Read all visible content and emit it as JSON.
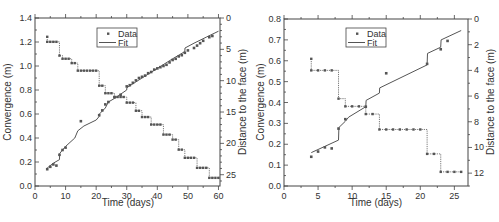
{
  "chart_data": [
    {
      "type": "scatter+line",
      "panel": "left",
      "title": "",
      "xlabel": "Time (days)",
      "ylabel": "Convergence (m)",
      "y2label": "Distance to the face (m)",
      "xlim": [
        0,
        60.5
      ],
      "ylim": [
        0.0,
        1.4
      ],
      "y2lim": [
        0,
        26.8
      ],
      "y2_inverted": true,
      "xticks": [
        0,
        10,
        20,
        30,
        40,
        50,
        60
      ],
      "yticks": [
        0.0,
        0.2,
        0.4,
        0.6,
        0.8,
        1.0,
        1.2,
        1.4
      ],
      "y2ticks": [
        0,
        5,
        10,
        15,
        20,
        25
      ],
      "legend": {
        "position": "upper-center",
        "entries": [
          "Data",
          "Fit"
        ]
      },
      "series": [
        {
          "name": "Data",
          "axis": "left",
          "style": "markers",
          "x": [
            4,
            5,
            6,
            7,
            8,
            9,
            10,
            15,
            21,
            22,
            23,
            24,
            26,
            28,
            30,
            31,
            32,
            33,
            34,
            35,
            36,
            37,
            38,
            39,
            40,
            41,
            42,
            43,
            44,
            45,
            46,
            47,
            48,
            49,
            50,
            52,
            53,
            54,
            55,
            57,
            58
          ],
          "values": [
            0.14,
            0.16,
            0.18,
            0.17,
            0.26,
            0.3,
            0.32,
            0.54,
            0.59,
            0.63,
            0.68,
            0.7,
            0.74,
            0.76,
            0.83,
            0.84,
            0.86,
            0.88,
            0.9,
            0.91,
            0.92,
            0.94,
            0.95,
            0.97,
            0.98,
            0.99,
            1.0,
            1.01,
            1.03,
            1.05,
            1.06,
            1.08,
            1.09,
            1.11,
            1.13,
            1.15,
            1.17,
            1.19,
            1.21,
            1.24,
            1.25
          ]
        },
        {
          "name": "Fit",
          "axis": "left",
          "style": "line",
          "x": [
            4,
            6,
            8,
            8.05,
            9,
            10,
            13,
            14,
            16,
            20,
            21,
            21.05,
            23,
            24,
            26,
            30,
            30.05,
            35,
            40,
            45,
            49,
            49.05,
            52,
            56,
            60
          ],
          "values": [
            0.15,
            0.19,
            0.22,
            0.27,
            0.3,
            0.33,
            0.4,
            0.46,
            0.5,
            0.55,
            0.58,
            0.6,
            0.65,
            0.7,
            0.73,
            0.8,
            0.82,
            0.9,
            0.98,
            1.06,
            1.12,
            1.15,
            1.19,
            1.24,
            1.29
          ]
        },
        {
          "name": "Distance to the face",
          "axis": "right",
          "style": "step-markers",
          "x": [
            4,
            5,
            6,
            7,
            8,
            9,
            10,
            11,
            12,
            13,
            14,
            15,
            16,
            17,
            18,
            19,
            20,
            21,
            22,
            23,
            24,
            25,
            26,
            27,
            28,
            29,
            30,
            31,
            32,
            33,
            34,
            35,
            36,
            37,
            38,
            39,
            40,
            41,
            42,
            43,
            44,
            45,
            46,
            47,
            48,
            49,
            50,
            51,
            52,
            53,
            54,
            55,
            56,
            57,
            58,
            59,
            60
          ],
          "values": [
            3.8,
            3.8,
            3.8,
            3.8,
            6.0,
            6.5,
            6.5,
            6.5,
            7.2,
            7.2,
            8.4,
            8.4,
            8.4,
            8.4,
            8.4,
            8.4,
            8.4,
            10.8,
            10.8,
            12.0,
            12.0,
            12.0,
            12.6,
            12.6,
            12.6,
            12.6,
            13.5,
            13.5,
            13.5,
            14.8,
            14.8,
            15.8,
            15.8,
            15.8,
            17.0,
            17.0,
            17.0,
            17.0,
            18.6,
            18.6,
            18.6,
            19.4,
            19.4,
            21.0,
            21.0,
            22.3,
            22.3,
            22.3,
            22.3,
            23.9,
            23.9,
            23.9,
            23.9,
            25.5,
            25.5,
            25.5,
            25.5
          ],
          "first_point": {
            "x": 4,
            "value": 3.0
          }
        }
      ]
    },
    {
      "type": "scatter+line",
      "panel": "right",
      "title": "",
      "xlabel": "Time (days)",
      "ylabel": "Convergence (m)",
      "y2label": "Distance to the face (m)",
      "xlim": [
        0,
        27
      ],
      "ylim": [
        0.0,
        0.8
      ],
      "y2lim": [
        0,
        13
      ],
      "y2_inverted": true,
      "xticks": [
        0,
        5,
        10,
        15,
        20,
        25
      ],
      "yticks": [
        0.0,
        0.1,
        0.2,
        0.3,
        0.4,
        0.5,
        0.6,
        0.7,
        0.8
      ],
      "y2ticks": [
        0,
        2,
        4,
        6,
        8,
        10,
        12
      ],
      "legend": {
        "position": "upper-center",
        "entries": [
          "Data",
          "Fit"
        ]
      },
      "series": [
        {
          "name": "Data",
          "axis": "left",
          "style": "markers",
          "x": [
            4,
            5,
            6,
            7,
            8,
            9,
            12,
            15,
            21,
            23,
            24
          ],
          "values": [
            0.14,
            0.165,
            0.185,
            0.18,
            0.275,
            0.32,
            0.38,
            0.54,
            0.585,
            0.655,
            0.695
          ]
        },
        {
          "name": "Fit",
          "axis": "left",
          "style": "line",
          "x": [
            4,
            8,
            8.05,
            9,
            9.5,
            12,
            12.05,
            14,
            14.05,
            21,
            21.05,
            23,
            23.05,
            26
          ],
          "values": [
            0.16,
            0.22,
            0.28,
            0.31,
            0.33,
            0.38,
            0.41,
            0.445,
            0.47,
            0.58,
            0.635,
            0.665,
            0.7,
            0.745
          ]
        },
        {
          "name": "Distance to the face",
          "axis": "right",
          "style": "step-markers",
          "x": [
            4,
            5,
            6,
            7,
            8,
            9,
            10,
            11,
            12,
            13,
            14,
            15,
            16,
            17,
            18,
            19,
            20,
            21,
            22,
            23,
            24,
            25,
            26
          ],
          "values": [
            4,
            4,
            4,
            4,
            6.2,
            6.8,
            6.8,
            6.8,
            7.4,
            7.4,
            8.6,
            8.6,
            8.6,
            8.6,
            8.6,
            8.6,
            8.6,
            10.5,
            10.5,
            11.9,
            11.9,
            11.9,
            11.9
          ],
          "first_point": {
            "x": 4,
            "value": 3.1
          }
        }
      ]
    }
  ],
  "panels": {
    "left": {
      "xlabel": "Time (days)",
      "ylabel": "Convergence (m)",
      "y2label": "Distance to the face (m)",
      "legend_data": "Data",
      "legend_fit": "Fit"
    },
    "right": {
      "xlabel": "Time (days)",
      "ylabel": "Convergence (m)",
      "y2label": "Distance to the face (m)",
      "legend_data": "Data",
      "legend_fit": "Fit"
    }
  },
  "colors": {
    "axis": "#444444",
    "series": "#555555",
    "text": "#333333"
  }
}
